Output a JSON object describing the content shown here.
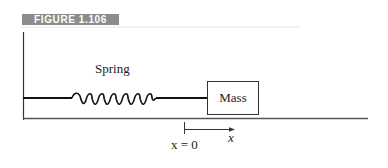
{
  "figure": {
    "label": "FIGURE 1.106",
    "badge_color": "#8c8c8c"
  },
  "diagram": {
    "spring_label": "Spring",
    "mass_label": "Mass",
    "axis_label": "x",
    "origin_label": "x = 0",
    "spring_coils": 8
  }
}
